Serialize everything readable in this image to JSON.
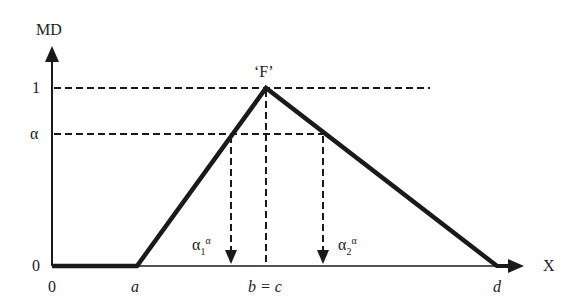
{
  "diagram": {
    "y_axis_label": "MD",
    "x_axis_label": "X",
    "y_ticks": [
      "1",
      "α",
      "0"
    ],
    "x_ticks": [
      "0",
      "a",
      "b = c",
      "d"
    ],
    "peak_label": "‘F’",
    "alpha_cut_left": {
      "base": "α",
      "sub": "1",
      "sup": "α"
    },
    "alpha_cut_right": {
      "base": "α",
      "sub": "2",
      "sup": "α"
    },
    "colors": {
      "line": "#1a1a1a",
      "background": "#ffffff"
    }
  }
}
